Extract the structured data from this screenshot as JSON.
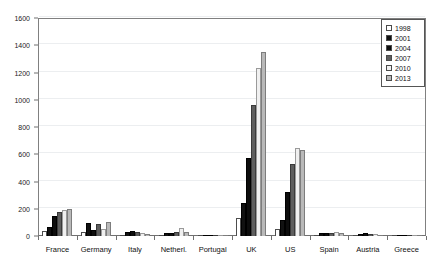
{
  "chart_data": {
    "type": "bar",
    "title": "",
    "xlabel": "",
    "ylabel": "",
    "ylim": [
      0,
      1600
    ],
    "ytick_step": 200,
    "yticks": [
      0,
      200,
      400,
      600,
      800,
      1000,
      1200,
      1400,
      1600
    ],
    "grid": true,
    "legend_position": "top-right",
    "categories": [
      "France",
      "Germany",
      "Italy",
      "Netherl.",
      "Portugal",
      "UK",
      "US",
      "Spain",
      "Austria",
      "Greece"
    ],
    "series": [
      {
        "name": "1998",
        "color": "#ffffff",
        "pattern": "empty",
        "values": [
          40,
          28,
          8,
          6,
          2,
          130,
          55,
          10,
          6,
          2
        ]
      },
      {
        "name": "2001",
        "color": "#111111",
        "pattern": "dotted-black",
        "values": [
          65,
          95,
          28,
          20,
          2,
          240,
          115,
          20,
          18,
          3
        ]
      },
      {
        "name": "2004",
        "color": "#0d0d0d",
        "pattern": "solid-black",
        "values": [
          150,
          42,
          38,
          22,
          3,
          570,
          320,
          22,
          20,
          3
        ]
      },
      {
        "name": "2007",
        "color": "#5e5e5e",
        "pattern": "dark-gray",
        "values": [
          175,
          88,
          30,
          30,
          3,
          960,
          530,
          25,
          18,
          3
        ]
      },
      {
        "name": "2010",
        "color": "#f0f0f0",
        "pattern": "light-gray",
        "values": [
          190,
          55,
          24,
          62,
          4,
          1235,
          645,
          30,
          12,
          3
        ]
      },
      {
        "name": "2013",
        "color": "#b9b9b9",
        "pattern": "medium-gray",
        "values": [
          200,
          105,
          18,
          32,
          4,
          1350,
          630,
          24,
          10,
          3
        ]
      }
    ]
  },
  "legend": {
    "entries": [
      {
        "label": "1998"
      },
      {
        "label": "2001"
      },
      {
        "label": "2004"
      },
      {
        "label": "2007"
      },
      {
        "label": "2010"
      },
      {
        "label": "2013"
      }
    ]
  }
}
